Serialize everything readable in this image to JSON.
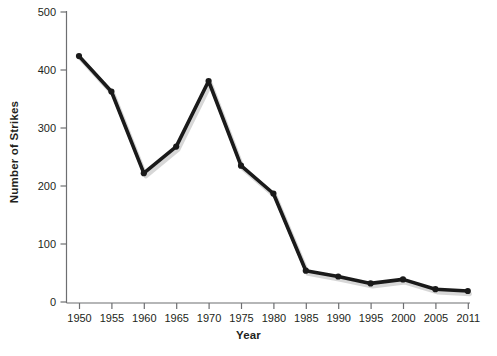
{
  "chart_data": {
    "type": "line",
    "title": "",
    "xlabel": "Year",
    "ylabel": "Number of Strikes",
    "x": [
      1950,
      1955,
      1960,
      1965,
      1970,
      1975,
      1980,
      1985,
      1990,
      1995,
      2000,
      2005,
      2011
    ],
    "xtick_labels": [
      "1950",
      "1955",
      "1960",
      "1965",
      "1970",
      "1975",
      "1980",
      "1985",
      "1990",
      "1995",
      "2000",
      "2005",
      "2011"
    ],
    "values": [
      424,
      363,
      222,
      268,
      381,
      235,
      187,
      54,
      44,
      32,
      39,
      22,
      19
    ],
    "ytick_labels": [
      "0",
      "100",
      "200",
      "300",
      "400",
      "500"
    ],
    "yticks": [
      0,
      100,
      200,
      300,
      400,
      500
    ],
    "ylim": [
      0,
      500
    ],
    "grid": false,
    "legend": "none",
    "series": [
      {
        "name": "Number of Strikes",
        "values": [
          424,
          363,
          222,
          268,
          381,
          235,
          187,
          54,
          44,
          32,
          39,
          22,
          19
        ]
      }
    ],
    "colors": {
      "line": "#1a1a1a",
      "marker": "#1a1a1a",
      "axis": "#6d6e71",
      "text": "#231f20",
      "background": "#ffffff",
      "shadow": "#c9c9c9"
    }
  }
}
